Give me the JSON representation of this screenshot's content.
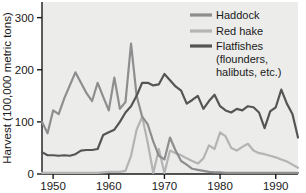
{
  "chart_data": {
    "type": "line",
    "title": "",
    "xlabel": "",
    "ylabel": "Harvest (100,000 metric tons)",
    "xlim": [
      1948,
      1994
    ],
    "ylim": [
      0,
      330
    ],
    "xticks": [
      1950,
      1960,
      1970,
      1980,
      1990
    ],
    "xticklabels": [
      "1950",
      "1960",
      "1970",
      "1980",
      "1990"
    ],
    "yticks": [
      0,
      100,
      200,
      300
    ],
    "yticklabels": [
      "0",
      "100",
      "200",
      "300"
    ],
    "grid": false,
    "legend_position": "top-right",
    "plot_background": "#ececeb",
    "series": [
      {
        "name": "Haddock",
        "color": "#8e8e8e",
        "x": [
          1948,
          1949,
          1950,
          1951,
          1952,
          1953,
          1954,
          1955,
          1956,
          1957,
          1958,
          1959,
          1960,
          1961,
          1962,
          1963,
          1964,
          1965,
          1966,
          1967,
          1968,
          1969,
          1970,
          1971,
          1972,
          1973,
          1974,
          1975,
          1976,
          1977,
          1978,
          1979,
          1980,
          1981,
          1982,
          1983,
          1984,
          1985,
          1986,
          1987,
          1988,
          1989,
          1990,
          1991,
          1992,
          1993,
          1994
        ],
        "values": [
          100,
          78,
          122,
          115,
          145,
          170,
          195,
          175,
          155,
          140,
          175,
          148,
          122,
          185,
          125,
          138,
          250,
          150,
          110,
          95,
          62,
          35,
          28,
          70,
          45,
          25,
          18,
          10,
          8,
          6,
          4,
          3,
          3,
          2,
          2,
          2,
          2,
          2,
          2,
          2,
          2,
          2,
          2,
          2,
          2,
          2,
          2
        ]
      },
      {
        "name": "Red hake",
        "color": "#b4b4b4",
        "x": [
          1948,
          1949,
          1950,
          1951,
          1952,
          1953,
          1954,
          1955,
          1956,
          1957,
          1958,
          1959,
          1960,
          1961,
          1962,
          1963,
          1964,
          1965,
          1966,
          1967,
          1968,
          1969,
          1970,
          1971,
          1972,
          1973,
          1974,
          1975,
          1976,
          1977,
          1978,
          1979,
          1980,
          1981,
          1982,
          1983,
          1984,
          1985,
          1986,
          1987,
          1988,
          1989,
          1990,
          1991,
          1992,
          1993,
          1994
        ],
        "values": [
          2,
          2,
          2,
          2,
          2,
          2,
          2,
          2,
          2,
          2,
          2,
          3,
          4,
          4,
          4,
          6,
          35,
          85,
          110,
          60,
          2,
          48,
          2,
          45,
          40,
          36,
          30,
          25,
          20,
          30,
          55,
          48,
          80,
          72,
          50,
          45,
          52,
          58,
          45,
          40,
          38,
          35,
          32,
          28,
          24,
          18,
          12
        ]
      },
      {
        "name": "Flatfishes (flounders, halibuts, etc.)",
        "color": "#555555",
        "x": [
          1948,
          1949,
          1950,
          1951,
          1952,
          1953,
          1954,
          1955,
          1956,
          1957,
          1958,
          1959,
          1960,
          1961,
          1962,
          1963,
          1964,
          1965,
          1966,
          1967,
          1968,
          1969,
          1970,
          1971,
          1972,
          1973,
          1974,
          1975,
          1976,
          1977,
          1978,
          1979,
          1980,
          1981,
          1982,
          1983,
          1984,
          1985,
          1986,
          1987,
          1988,
          1989,
          1990,
          1991,
          1992,
          1993,
          1994
        ],
        "values": [
          42,
          36,
          36,
          35,
          36,
          35,
          38,
          45,
          46,
          46,
          48,
          75,
          80,
          85,
          100,
          118,
          130,
          150,
          175,
          175,
          170,
          172,
          192,
          180,
          168,
          160,
          135,
          142,
          150,
          125,
          140,
          152,
          130,
          122,
          118,
          125,
          122,
          130,
          128,
          118,
          88,
          120,
          128,
          162,
          135,
          115,
          70
        ]
      }
    ],
    "legend": [
      {
        "label": "Haddock",
        "color": "#8e8e8e",
        "sublabel": ""
      },
      {
        "label": "Red hake",
        "color": "#b4b4b4",
        "sublabel": ""
      },
      {
        "label": "Flatfishes",
        "color": "#555555",
        "sublabel_line1": "(flounders,",
        "sublabel_line2": "halibuts, etc.)"
      }
    ]
  }
}
